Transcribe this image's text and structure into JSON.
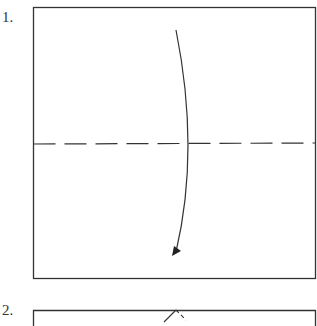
{
  "steps": [
    {
      "number": "1.",
      "description": "Square with horizontal dashed valley-fold line at the middle; curved arrow indicates folding top half down."
    },
    {
      "number": "2.",
      "description": "Second step (partially visible): square with a small peak at the top edge, left side solid, right side dashed."
    }
  ],
  "colors": {
    "line": "#333333",
    "background": "#ffffff"
  }
}
